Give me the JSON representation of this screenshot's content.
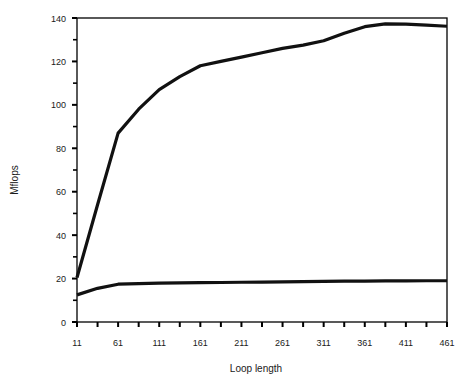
{
  "chart_data": {
    "type": "line",
    "title": "",
    "xlabel": "Loop length",
    "ylabel": "Mflops",
    "xlim": [
      11,
      461
    ],
    "ylim": [
      0,
      140
    ],
    "grid": false,
    "legend": "none",
    "x_tick_labels": [
      "11",
      "61",
      "111",
      "161",
      "211",
      "261",
      "311",
      "361",
      "411",
      "461"
    ],
    "x_tick_values": [
      11,
      61,
      111,
      161,
      211,
      261,
      311,
      361,
      411,
      461
    ],
    "x_minor_tick_values": [
      36,
      86,
      136,
      186,
      236,
      286,
      336,
      386,
      436
    ],
    "y_tick_labels": [
      "0",
      "20",
      "40",
      "60",
      "80",
      "100",
      "120",
      "140"
    ],
    "y_tick_values": [
      0,
      20,
      40,
      60,
      80,
      100,
      120,
      140
    ],
    "y_minor_tick_values": [
      10,
      30,
      50,
      70,
      90,
      110,
      130
    ],
    "x": [
      11,
      36,
      61,
      86,
      111,
      136,
      161,
      186,
      211,
      236,
      261,
      286,
      311,
      336,
      361,
      386,
      411,
      436,
      461
    ],
    "series": [
      {
        "name": "upper-curve",
        "color": "#111111",
        "width": 3.2,
        "values": [
          20.5,
          54.0,
          87.0,
          98.0,
          107.0,
          113.0,
          118.0,
          120.0,
          122.0,
          124.0,
          126.0,
          127.5,
          129.5,
          133.0,
          136.0,
          137.3,
          137.2,
          136.7,
          136.2
        ]
      },
      {
        "name": "lower-curve",
        "color": "#111111",
        "width": 3.2,
        "values": [
          12.5,
          15.5,
          17.4,
          17.7,
          17.9,
          18.0,
          18.1,
          18.2,
          18.3,
          18.4,
          18.5,
          18.6,
          18.7,
          18.8,
          18.85,
          18.9,
          18.95,
          19.0,
          19.0
        ]
      }
    ],
    "colors": {
      "axis": "#000000",
      "text": "#1a1a1a",
      "background": "#ffffff",
      "series": "#111111"
    }
  },
  "plot_geometry": {
    "left": 77,
    "right": 447,
    "top": 18,
    "bottom": 322
  }
}
